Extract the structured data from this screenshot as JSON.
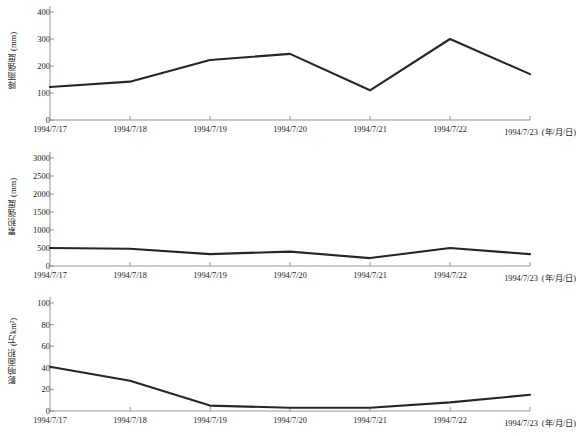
{
  "chart_data": [
    {
      "type": "line",
      "panel_index": 0,
      "title": "",
      "xlabel": "(年/月/日)",
      "ylabel": "降雨强度 (mm)",
      "categories": [
        "1994/7/17",
        "1994/7/18",
        "1994/7/19",
        "1994/7/20",
        "1994/7/21",
        "1994/7/22",
        "1994/7/23"
      ],
      "values": [
        122,
        142,
        222,
        245,
        110,
        300,
        170
      ],
      "yticks": [
        0,
        100,
        200,
        300,
        400
      ],
      "ylim": [
        0,
        400
      ],
      "grid": false,
      "legend": "none",
      "line_color": "#262626"
    },
    {
      "type": "line",
      "panel_index": 1,
      "title": "",
      "xlabel": "(年/月/日)",
      "ylabel": "累积强度 (mm)",
      "categories": [
        "1994/7/17",
        "1994/7/18",
        "1994/7/19",
        "1994/7/20",
        "1994/7/21",
        "1994/7/22",
        "1994/7/23"
      ],
      "values": [
        500,
        480,
        330,
        400,
        220,
        500,
        330
      ],
      "yticks": [
        0,
        500,
        1000,
        1500,
        2000,
        2500,
        3000
      ],
      "ylim": [
        0,
        3000
      ],
      "grid": false,
      "legend": "none",
      "line_color": "#262626"
    },
    {
      "type": "line",
      "panel_index": 2,
      "title": "",
      "xlabel": "(年/月/日)",
      "ylabel": "影响面积 (万km²)",
      "categories": [
        "1994/7/17",
        "1994/7/18",
        "1994/7/19",
        "1994/7/20",
        "1994/7/21",
        "1994/7/22",
        "1994/7/23"
      ],
      "values": [
        41,
        28,
        5,
        3,
        3,
        8,
        15
      ],
      "yticks": [
        0,
        20,
        40,
        60,
        80,
        100
      ],
      "ylim": [
        0,
        100
      ],
      "grid": false,
      "legend": "none",
      "line_color": "#262626"
    }
  ],
  "figure": {
    "background": "#ffffff",
    "axis_color": "#8a8a8a",
    "text_color": "#1a1a1a",
    "panel_count": 3
  }
}
